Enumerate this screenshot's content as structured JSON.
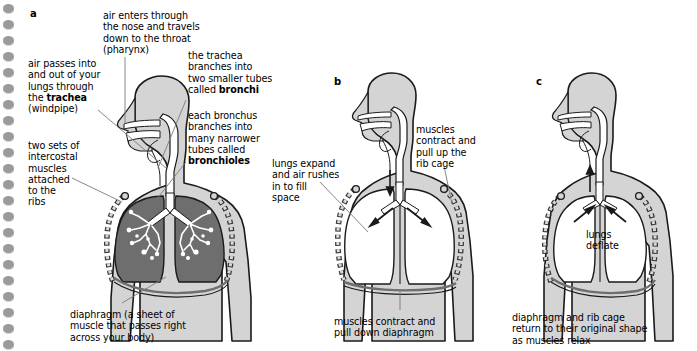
{
  "figure": {
    "type": "anatomy-diagram",
    "background_color": "#ffffff",
    "body_fill": "#d4d4d4",
    "lung_fill_dark": "#6e6e6e",
    "lung_fill_light": "#ffffff",
    "airway_fill": "#ffffff",
    "outline_color": "#1a1a1a",
    "leader_color": "#555555"
  },
  "binding": {
    "name": "spiral-binding-holes",
    "hole_count": 22,
    "hole_color": "#9b9b9b"
  },
  "panels": [
    {
      "id": "a",
      "label": "a",
      "caption": "respiratory system anatomy"
    },
    {
      "id": "b",
      "label": "b",
      "caption": "breathing in (inhalation)"
    },
    {
      "id": "c",
      "label": "c",
      "caption": "breathing out (exhalation)"
    }
  ],
  "annotations": {
    "a": [
      {
        "name": "label-nose-pharynx",
        "text": "air enters through\nthe nose and travels\ndown to the throat\n(pharynx)",
        "x": 103,
        "y": 10
      },
      {
        "name": "label-trachea",
        "text_parts": [
          {
            "t": "air passes into\nand out of your\nlungs through\nthe ",
            "bold": false
          },
          {
            "t": "trachea",
            "bold": true
          },
          {
            "t": "\n(windpipe)",
            "bold": false
          }
        ],
        "x": 28,
        "y": 58
      },
      {
        "name": "label-bronchi",
        "text_parts": [
          {
            "t": "the trachea\nbranches into\ntwo smaller tubes\ncalled ",
            "bold": false
          },
          {
            "t": "bronchi",
            "bold": true
          }
        ],
        "x": 188,
        "y": 50
      },
      {
        "name": "label-bronchioles",
        "text_parts": [
          {
            "t": "each bronchus\nbranches into\nmany narrower\ntubes called\n",
            "bold": false
          },
          {
            "t": "bronchioles",
            "bold": true
          }
        ],
        "x": 188,
        "y": 110
      },
      {
        "name": "label-intercostal-muscles",
        "text": "two sets of\nintercostal\nmuscles\nattached\nto the\nribs",
        "x": 28,
        "y": 140
      },
      {
        "name": "label-diaphragm",
        "text": "diaphragm (a sheet of\nmuscle that passes right\nacross your body)",
        "x": 70,
        "y": 309
      }
    ],
    "b": [
      {
        "name": "label-lungs-expand",
        "text": "lungs expand\nand air rushes\nin to fill\nspace",
        "x": 272,
        "y": 158
      },
      {
        "name": "label-muscles-contract-ribs",
        "text": "muscles\ncontract and\npull up the\nrib cage",
        "x": 416,
        "y": 124
      },
      {
        "name": "label-muscles-pull-diaphragm",
        "text": "muscles contract and\npull down diaphragm",
        "x": 334,
        "y": 316
      }
    ],
    "c": [
      {
        "name": "label-lungs-deflate",
        "text": "lungs\ndeflate",
        "x": 586,
        "y": 229
      },
      {
        "name": "label-return-original-shape",
        "text": "diaphragm and rib cage\nreturn to their original shape\nas muscles relax",
        "x": 512,
        "y": 312
      }
    ]
  }
}
